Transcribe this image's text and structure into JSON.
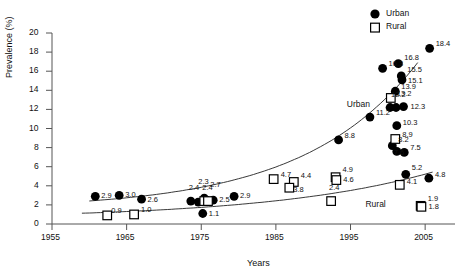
{
  "chart_data": {
    "type": "scatter",
    "title": "",
    "xlabel": "Years",
    "ylabel": "Prevalence (%)",
    "xlim": [
      1955,
      2009
    ],
    "ylim": [
      0,
      20
    ],
    "xticks": [
      1955,
      1965,
      1975,
      1985,
      1995,
      2005
    ],
    "yticks": [
      0,
      2,
      4,
      6,
      8,
      10,
      12,
      14,
      16,
      18,
      20
    ],
    "grid": false,
    "legend": {
      "position": "top-right",
      "entries": [
        {
          "name": "Urban",
          "marker": "filled-circle",
          "color": "#000000"
        },
        {
          "name": "Rural",
          "marker": "open-square",
          "color": "#000000"
        }
      ]
    },
    "annotations": [
      {
        "text": "Urban",
        "x": 1994.5,
        "y": 12.6
      },
      {
        "text": "Rural",
        "x": 1997.0,
        "y": 2.1
      }
    ],
    "series": [
      {
        "name": "Urban",
        "marker": "filled-circle",
        "points": [
          {
            "x": 1960.8,
            "y": 2.9,
            "label": "2.9"
          },
          {
            "x": 1964.0,
            "y": 3.0,
            "label": "3.0"
          },
          {
            "x": 1967.0,
            "y": 2.6,
            "label": "2.6"
          },
          {
            "x": 1973.6,
            "y": 2.4,
            "label": "2.4"
          },
          {
            "x": 1974.6,
            "y": 2.3,
            "label": "2.3"
          },
          {
            "x": 1975.4,
            "y": 2.7,
            "label": "2.7"
          },
          {
            "x": 1975.2,
            "y": 1.1,
            "label": "1.1"
          },
          {
            "x": 1976.6,
            "y": 2.5,
            "label": "2.5"
          },
          {
            "x": 1979.4,
            "y": 2.9,
            "label": "2.9"
          },
          {
            "x": 1993.4,
            "y": 8.8,
            "label": "8.8"
          },
          {
            "x": 1997.6,
            "y": 11.2,
            "label": "11.2"
          },
          {
            "x": 1999.3,
            "y": 16.3,
            "label": "16.3"
          },
          {
            "x": 2000.3,
            "y": 12.2,
            "label": "12.2"
          },
          {
            "x": 2001.1,
            "y": 12.2,
            "label": ""
          },
          {
            "x": 2001.0,
            "y": 13.9,
            "label": "13.9"
          },
          {
            "x": 2001.4,
            "y": 16.8,
            "label": "16.8"
          },
          {
            "x": 2001.8,
            "y": 15.5,
            "label": "15.5"
          },
          {
            "x": 2001.9,
            "y": 15.1,
            "label": "15.1"
          },
          {
            "x": 2002.1,
            "y": 12.3,
            "label": "12.3"
          },
          {
            "x": 2001.2,
            "y": 10.3,
            "label": "10.3"
          },
          {
            "x": 2000.6,
            "y": 8.2,
            "label": "8.2"
          },
          {
            "x": 2001.2,
            "y": 7.6,
            "label": "7.6"
          },
          {
            "x": 2002.2,
            "y": 7.5,
            "label": "7.5"
          },
          {
            "x": 2002.4,
            "y": 5.2,
            "label": "5.2"
          },
          {
            "x": 2005.5,
            "y": 4.8,
            "label": "4.8"
          },
          {
            "x": 2005.6,
            "y": 18.4,
            "label": "18.4"
          }
        ]
      },
      {
        "name": "Rural",
        "marker": "open-square",
        "points": [
          {
            "x": 1962.4,
            "y": 0.9,
            "label": "0.9"
          },
          {
            "x": 1966.0,
            "y": 1.0,
            "label": "1.0"
          },
          {
            "x": 1975.4,
            "y": 2.4,
            "label": "2.4"
          },
          {
            "x": 1975.9,
            "y": 2.4,
            "label": ""
          },
          {
            "x": 1984.7,
            "y": 4.7,
            "label": "4.7"
          },
          {
            "x": 1987.4,
            "y": 4.4,
            "label": "4.4"
          },
          {
            "x": 1986.8,
            "y": 3.8,
            "label": "3.8"
          },
          {
            "x": 1993.0,
            "y": 4.9,
            "label": "4.9"
          },
          {
            "x": 1993.1,
            "y": 4.6,
            "label": "4.6"
          },
          {
            "x": 1992.4,
            "y": 2.4,
            "label": "2.4"
          },
          {
            "x": 2000.4,
            "y": 13.2,
            "label": "13.2"
          },
          {
            "x": 2001.0,
            "y": 8.9,
            "label": "8.9"
          },
          {
            "x": 2001.6,
            "y": 4.1,
            "label": "4.1"
          },
          {
            "x": 2004.4,
            "y": 1.9,
            "label": "1.9"
          },
          {
            "x": 2004.5,
            "y": 1.8,
            "label": "1.8"
          }
        ]
      }
    ],
    "trend_curves": [
      {
        "name": "Urban",
        "from": 1960,
        "to": 2004
      },
      {
        "name": "Rural",
        "from": 1959,
        "to": 2006
      }
    ]
  }
}
